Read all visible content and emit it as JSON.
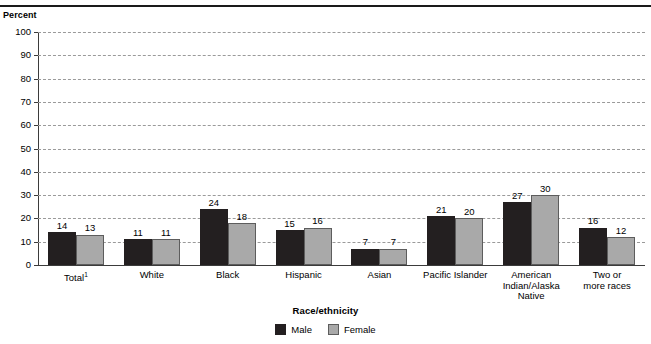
{
  "header": {
    "y_axis_unit_label": "Percent"
  },
  "chart_data": {
    "type": "bar",
    "title": "",
    "xlabel": "Race/ethnicity",
    "ylabel": "Percent",
    "ylim": [
      0,
      100
    ],
    "ytick_step": 10,
    "yticks": [
      0,
      10,
      20,
      30,
      40,
      50,
      60,
      70,
      80,
      90,
      100
    ],
    "grid": true,
    "grid_style": "dashed-horizontal",
    "legend_position": "bottom-center",
    "categories": [
      "Total¹",
      "White",
      "Black",
      "Hispanic",
      "Asian",
      "Pacific Islander",
      "American\nIndian/Alaska\nNative",
      "Two or\nmore races"
    ],
    "series": [
      {
        "name": "Male",
        "color": "#231f20",
        "values": [
          14,
          11,
          24,
          15,
          7,
          21,
          27,
          16
        ]
      },
      {
        "name": "Female",
        "color": "#a9a9a9",
        "values": [
          13,
          11,
          18,
          16,
          7,
          20,
          30,
          12
        ]
      }
    ],
    "annotations": [
      "Total¹ category carries a footnote marker 1"
    ]
  }
}
